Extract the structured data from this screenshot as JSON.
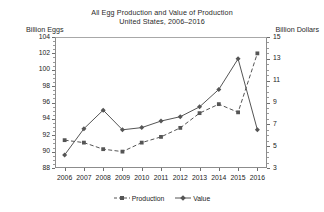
{
  "chart_data": {
    "type": "line",
    "title": "All Egg Production and Value of Production",
    "subtitle": "United States, 2006–2016",
    "xlabel": "",
    "ylabel": "Billion Eggs",
    "ylabel_right": "Billion Dollars",
    "categories": [
      "2006",
      "2007",
      "2008",
      "2009",
      "2010",
      "2011",
      "2012",
      "2013",
      "2014",
      "2015",
      "2016"
    ],
    "ylim": [
      88,
      104
    ],
    "yticks": [
      88,
      90,
      92,
      94,
      96,
      98,
      100,
      102,
      104
    ],
    "ylim_right": [
      3,
      15
    ],
    "yticks_right": [
      3,
      5,
      7,
      9,
      11,
      13,
      15
    ],
    "grid": false,
    "legend_position": "bottom",
    "series": [
      {
        "name": "Production",
        "axis": "left",
        "units": "Billion Eggs",
        "line_style": "dashed",
        "marker": "square",
        "color": "#555555",
        "values": [
          91.4,
          91.1,
          90.3,
          90.0,
          91.1,
          91.8,
          92.9,
          94.7,
          95.8,
          94.8,
          102.0
        ]
      },
      {
        "name": "Value",
        "axis": "right",
        "units": "Billion Dollars",
        "line_style": "solid",
        "marker": "diamond",
        "color": "#555555",
        "values": [
          4.2,
          6.6,
          8.3,
          6.5,
          6.7,
          7.3,
          7.7,
          8.6,
          10.2,
          13.0,
          6.5
        ]
      }
    ]
  },
  "legend": {
    "items": [
      {
        "label": "Production"
      },
      {
        "label": "Value"
      }
    ]
  }
}
